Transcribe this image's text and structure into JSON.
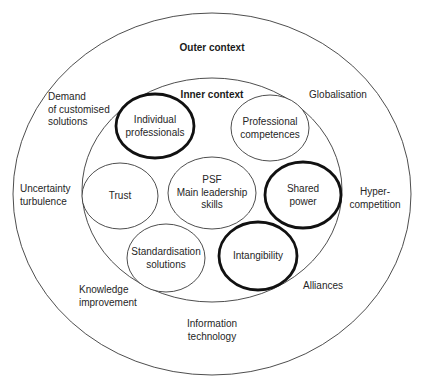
{
  "diagram": {
    "outer": {
      "title": "Outer context",
      "cx": 212,
      "cy": 194,
      "rx": 199,
      "ry": 181
    },
    "inner": {
      "title": "Inner context",
      "cx": 212,
      "cy": 190,
      "rx": 130,
      "ry": 112
    },
    "nodes": [
      {
        "id": "individual-professionals",
        "label": "Individual\nprofessionals",
        "cx": 155,
        "cy": 126,
        "rx": 39,
        "ry": 32,
        "emphasis": true
      },
      {
        "id": "professional-competences",
        "label": "Professional\ncompetences",
        "cx": 270,
        "cy": 128,
        "rx": 39,
        "ry": 33,
        "emphasis": false
      },
      {
        "id": "trust",
        "label": "Trust",
        "cx": 120,
        "cy": 196,
        "rx": 38,
        "ry": 33,
        "emphasis": false
      },
      {
        "id": "psf-main-leadership-skills",
        "label": "PSF\nMain leadership\nskills",
        "cx": 212,
        "cy": 193,
        "rx": 44,
        "ry": 36,
        "emphasis": false
      },
      {
        "id": "shared-power",
        "label": "Shared\npower",
        "cx": 303,
        "cy": 195,
        "rx": 38,
        "ry": 33,
        "emphasis": true
      },
      {
        "id": "standardisation-solutions",
        "label": "Standardisation\nsolutions",
        "cx": 166,
        "cy": 258,
        "rx": 39,
        "ry": 34,
        "emphasis": false
      },
      {
        "id": "intangibility",
        "label": "Intangibility",
        "cx": 258,
        "cy": 256,
        "rx": 39,
        "ry": 34,
        "emphasis": true
      }
    ],
    "outer_factors": [
      {
        "id": "demand-customised-solutions",
        "label": "Demand\nof customised\nsolutions",
        "x": 48,
        "y": 110,
        "align": "left"
      },
      {
        "id": "globalisation",
        "label": "Globalisation",
        "x": 338,
        "y": 95,
        "align": "center"
      },
      {
        "id": "uncertainty-turbulence",
        "label": "Uncertainty\nturbulence",
        "x": 20,
        "y": 195,
        "align": "left"
      },
      {
        "id": "hyper-competition",
        "label": "Hyper-\ncompetition",
        "x": 375,
        "y": 198,
        "align": "center"
      },
      {
        "id": "knowledge-improvement",
        "label": "Knowledge\nimprovement",
        "x": 79,
        "y": 296,
        "align": "left"
      },
      {
        "id": "alliances",
        "label": "Alliances",
        "x": 323,
        "y": 286,
        "align": "center"
      },
      {
        "id": "information-technology",
        "label": "Information\ntechnology",
        "x": 212,
        "y": 330,
        "align": "center"
      }
    ],
    "headings": {
      "outer_title_pos": {
        "x": 212,
        "y": 48
      },
      "inner_title_pos": {
        "x": 212,
        "y": 95
      }
    },
    "colors": {
      "line": "#3a3a3a",
      "emphasis_line": "#111111",
      "text": "#262626",
      "background": "#ffffff"
    }
  }
}
